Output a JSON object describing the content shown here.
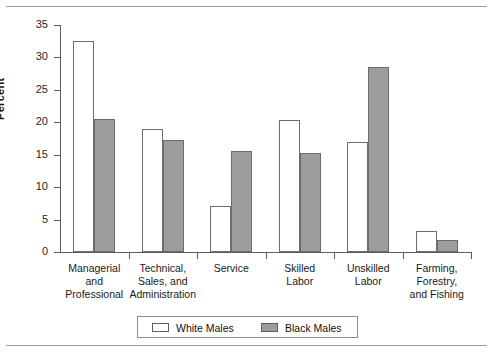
{
  "chart_data": {
    "type": "bar",
    "title": "",
    "subtitle": "",
    "xlabel": "",
    "ylabel": "Percent",
    "ylim": [
      0,
      35
    ],
    "yticks": [
      0,
      5,
      10,
      15,
      20,
      25,
      30,
      35
    ],
    "ytick_labels": [
      "0",
      "5",
      "10",
      "15",
      "20",
      "25",
      "30",
      "35"
    ],
    "grid": false,
    "legend_position": "bottom",
    "categories": [
      "Managerial and Professional",
      "Technical, Sales, and Administration",
      "Service",
      "Skilled Labor",
      "Unskilled Labor",
      "Farming, Forestry, and Fishing"
    ],
    "category_label_lines": [
      [
        "Managerial",
        "and",
        "Professional"
      ],
      [
        "Technical,",
        "Sales, and",
        "Administration"
      ],
      [
        "Service"
      ],
      [
        "Skilled",
        "Labor"
      ],
      [
        "Unskilled",
        "Labor"
      ],
      [
        "Farming,",
        "Forestry,",
        "and Fishing"
      ]
    ],
    "series": [
      {
        "name": "White Males",
        "color": "#ffffff",
        "values": [
          32.5,
          19.0,
          7.1,
          20.4,
          17.0,
          3.2
        ]
      },
      {
        "name": "Black Males",
        "color": "#9d9d9d",
        "values": [
          20.5,
          17.3,
          15.5,
          15.3,
          28.6,
          1.8
        ]
      }
    ]
  },
  "legend": {
    "entries": [
      {
        "label": "White Males",
        "swatch": "white"
      },
      {
        "label": "Black Males",
        "swatch": "gray"
      }
    ]
  }
}
